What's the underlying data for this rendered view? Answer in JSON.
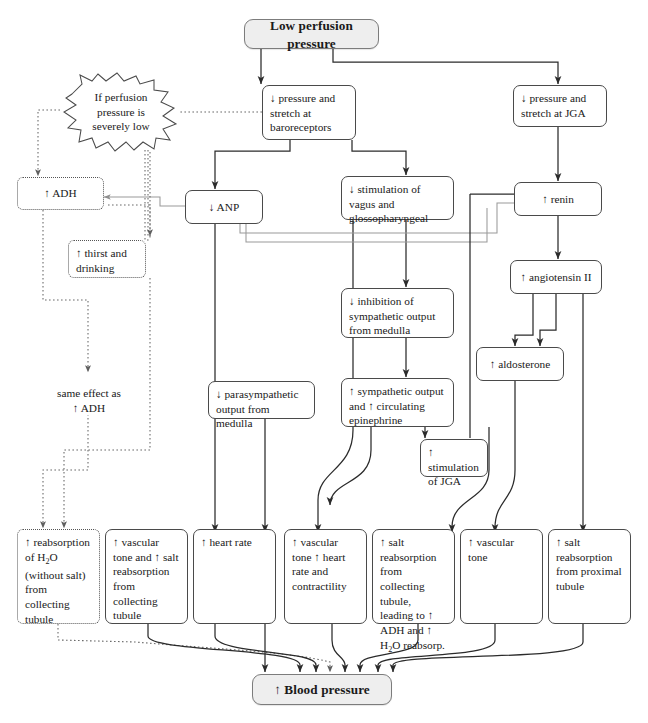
{
  "diagram": {
    "title_node": {
      "label": "Low perfusion pressure"
    },
    "terminal_node": {
      "label": "↑ Blood pressure"
    },
    "burst": {
      "label": "If perfusion pressure is severely low"
    },
    "free_text": {
      "same_effect": "same effect as ↑ ADH"
    },
    "nodes": {
      "baroreceptors": "↓ pressure and stretch at baroreceptors",
      "jga_pressure": "↓ pressure and stretch at JGA",
      "adh": "↑ ADH",
      "thirst": "↑ thirst and drinking",
      "anp": "↓ ANP",
      "vagus": "↓ stimulation of vagus and glossopharyngeal",
      "renin": "↑ renin",
      "angiotensin": "↑ angiotensin II",
      "inhibition": "↓ inhibition of sympathetic output from medulla",
      "aldosterone": "↑ aldosterone",
      "parasympathetic": "↓ parasympathetic output from medulla",
      "sympathetic": "↑ sympathetic output and ↑ circulating epinephrine",
      "jga_stim": "↑ stimulation of JGA"
    },
    "outcomes": [
      "↑ reabsorption of H<sub>2</sub>O (without salt) from collecting tubule",
      "↑ vascular tone and ↑ salt reabsorption from collecting tubule",
      "↑ heart rate",
      "↑ vascular tone ↑ heart rate and contractility",
      "↑ salt reabsorption from collecting tubule, leading to ↑ ADH and ↑ H<sub>2</sub>O reabsorp.",
      "↑ vascular tone",
      "↑ salt reabsorption from proximal tubule"
    ],
    "colors": {
      "stroke_dark": "#2b2b2b",
      "stroke_gray": "#9a9a9a",
      "stroke_dotted": "#6b6b6b",
      "box_border": "#4a4a4a",
      "terminal_fill": "#eeeeee"
    }
  }
}
